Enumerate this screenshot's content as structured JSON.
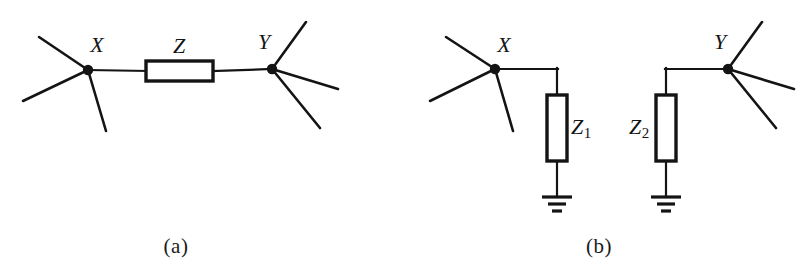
{
  "figure": {
    "background_color": "#ffffff",
    "stroke_color": "#141414",
    "panels": [
      {
        "id": "a",
        "caption": "(a)",
        "caption_pos": {
          "x": 176,
          "y": 246
        },
        "description": "Series impedance Z connecting node X to node Y",
        "nodes": [
          {
            "name": "X",
            "label": "X",
            "label_pos": {
              "x": 97,
              "y": 45
            },
            "dot": {
              "x": 88,
              "y": 70,
              "r": 5
            },
            "stub_lines": [
              {
                "x2": 39,
                "y2": 37
              },
              {
                "x2": 23,
                "y2": 101
              },
              {
                "x2": 106,
                "y2": 131
              }
            ]
          },
          {
            "name": "Y",
            "label": "Y",
            "label_pos": {
              "x": 264,
              "y": 42
            },
            "dot": {
              "x": 272,
              "y": 69,
              "r": 5
            },
            "stub_lines": [
              {
                "x2": 306,
                "y2": 22
              },
              {
                "x2": 338,
                "y2": 89
              },
              {
                "x2": 320,
                "y2": 128
              }
            ]
          }
        ],
        "impedances": [
          {
            "name": "Z",
            "label": "Z",
            "subscript": "",
            "label_pos": {
              "x": 179,
              "y": 46
            },
            "box": {
              "x": 146,
              "y": 61,
              "w": 67,
              "h": 20
            },
            "orientation": "horizontal"
          }
        ],
        "wires": [
          {
            "x1": 88,
            "y1": 70,
            "x2": 146,
            "y2": 71
          },
          {
            "x1": 213,
            "y1": 71,
            "x2": 272,
            "y2": 69
          }
        ],
        "grounds": []
      },
      {
        "id": "b",
        "caption": "(b)",
        "caption_pos": {
          "x": 599,
          "y": 246
        },
        "description": "Node X shunted to ground through Z1 and node Y shunted to ground through Z2",
        "nodes": [
          {
            "name": "X",
            "label": "X",
            "label_pos": {
              "x": 504,
              "y": 45
            },
            "dot": {
              "x": 495,
              "y": 69,
              "r": 5
            },
            "stub_lines": [
              {
                "x2": 446,
                "y2": 37
              },
              {
                "x2": 430,
                "y2": 101
              },
              {
                "x2": 513,
                "y2": 131
              }
            ]
          },
          {
            "name": "Y",
            "label": "Y",
            "label_pos": {
              "x": 720,
              "y": 42
            },
            "dot": {
              "x": 728,
              "y": 69,
              "r": 5
            },
            "stub_lines": [
              {
                "x2": 762,
                "y2": 22
              },
              {
                "x2": 794,
                "y2": 89
              },
              {
                "x2": 776,
                "y2": 128
              }
            ]
          }
        ],
        "impedances": [
          {
            "name": "Z1",
            "label": "Z",
            "subscript": "1",
            "label_pos": {
              "x": 581,
              "y": 128
            },
            "box": {
              "x": 547,
              "y": 95,
              "w": 20,
              "h": 66
            },
            "orientation": "vertical"
          },
          {
            "name": "Z2",
            "label": "Z",
            "subscript": "2",
            "label_pos": {
              "x": 639,
              "y": 128
            },
            "box": {
              "x": 656,
              "y": 95,
              "w": 20,
              "h": 66
            },
            "orientation": "vertical"
          }
        ],
        "wires": [
          {
            "x1": 495,
            "y1": 69,
            "x2": 557,
            "y2": 69
          },
          {
            "x1": 557,
            "y1": 69,
            "x2": 557,
            "y2": 95
          },
          {
            "x1": 557,
            "y1": 161,
            "x2": 557,
            "y2": 197
          },
          {
            "x1": 728,
            "y1": 69,
            "x2": 666,
            "y2": 69
          },
          {
            "x1": 666,
            "y1": 69,
            "x2": 666,
            "y2": 95
          },
          {
            "x1": 666,
            "y1": 161,
            "x2": 666,
            "y2": 197
          }
        ],
        "grounds": [
          {
            "x": 557,
            "y": 197
          },
          {
            "x": 666,
            "y": 197
          }
        ]
      }
    ]
  }
}
